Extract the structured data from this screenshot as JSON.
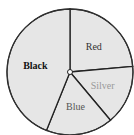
{
  "chart_data": {
    "type": "pie",
    "title": "",
    "categories": [
      "Red",
      "Silver",
      "Blue",
      "Black"
    ],
    "values": [
      23.6,
      15.3,
      17.2,
      43.9
    ],
    "start_angle_deg": 90,
    "direction": "clockwise",
    "fill_color": "#e6e6e6",
    "stroke_color": "#222222",
    "label_colors": {
      "Red": "#333333",
      "Silver": "#999999",
      "Blue": "#555555",
      "Black": "#111111"
    },
    "legend": "none"
  }
}
